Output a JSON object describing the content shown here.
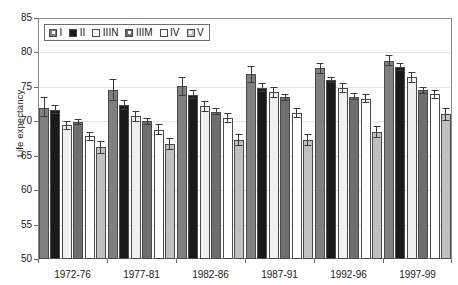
{
  "chart_data": {
    "type": "bar",
    "title": "",
    "subtitle": "",
    "xlabel": "",
    "ylabel": "Life expectancy",
    "ylim": [
      50,
      85
    ],
    "yticks": [
      50,
      55,
      60,
      65,
      70,
      75,
      80,
      85
    ],
    "grid": true,
    "legend_position": "top-left",
    "error_bars": true,
    "categories": [
      "1972-76",
      "1977-81",
      "1982-86",
      "1987-91",
      "1992-96",
      "1997-99"
    ],
    "series": [
      {
        "name": "I",
        "color": "#808080",
        "values": [
          72.0,
          74.6,
          75.1,
          76.8,
          77.7,
          78.8
        ],
        "err_low": [
          70.6,
          72.9,
          73.7,
          75.6,
          76.9,
          78.1
        ],
        "err_high": [
          73.5,
          76.2,
          76.4,
          78.0,
          78.5,
          79.6
        ]
      },
      {
        "name": "II",
        "color": "#1a1a1a",
        "values": [
          71.7,
          72.4,
          73.8,
          74.9,
          76.0,
          77.9
        ],
        "err_low": [
          71.0,
          71.7,
          73.2,
          74.3,
          75.5,
          77.3
        ],
        "err_high": [
          72.4,
          73.1,
          74.5,
          75.5,
          76.5,
          78.5
        ]
      },
      {
        "name": "IIIN",
        "color": "#f0f0f0",
        "values": [
          69.4,
          70.7,
          72.2,
          74.2,
          74.8,
          76.4
        ],
        "err_low": [
          68.7,
          69.9,
          71.4,
          73.4,
          74.1,
          75.6
        ],
        "err_high": [
          70.1,
          71.5,
          73.0,
          75.0,
          75.5,
          77.2
        ]
      },
      {
        "name": "IIIM",
        "color": "#6e6e6e",
        "values": [
          69.9,
          70.0,
          71.4,
          73.5,
          73.6,
          74.5
        ],
        "err_low": [
          69.4,
          69.5,
          70.9,
          73.0,
          73.1,
          74.0
        ],
        "err_high": [
          70.4,
          70.5,
          71.9,
          74.0,
          74.1,
          75.0
        ]
      },
      {
        "name": "IV",
        "color": "#ffffff",
        "values": [
          67.8,
          68.8,
          70.5,
          71.2,
          73.3,
          73.9
        ],
        "err_low": [
          67.2,
          68.0,
          69.8,
          70.5,
          72.6,
          73.2
        ],
        "err_high": [
          68.4,
          69.6,
          71.2,
          71.9,
          74.0,
          74.6
        ]
      },
      {
        "name": "V",
        "color": "#c0c0c0",
        "values": [
          66.2,
          66.7,
          67.3,
          67.3,
          68.4,
          71.0
        ],
        "err_low": [
          65.2,
          65.8,
          66.4,
          66.4,
          67.5,
          70.1
        ],
        "err_high": [
          67.2,
          67.6,
          68.2,
          68.2,
          69.3,
          71.9
        ]
      }
    ]
  },
  "axes": {
    "y_title": "Life expectancy",
    "y_tick_labels": [
      "85",
      "80",
      "75",
      "70",
      "65",
      "60",
      "55",
      "50"
    ],
    "x_tick_labels": [
      "1972-76",
      "1977-81",
      "1982-86",
      "1987-91",
      "1992-96",
      "1997-99"
    ]
  },
  "legend": {
    "items": [
      {
        "label": "I",
        "color": "#808080",
        "style": "inner"
      },
      {
        "label": "II",
        "color": "#1a1a1a",
        "style": "solid"
      },
      {
        "label": "IIIN",
        "color": "#f8f8f8",
        "style": "solid"
      },
      {
        "label": "IIIM",
        "color": "#6e6e6e",
        "style": "inner"
      },
      {
        "label": "IV",
        "color": "#ffffff",
        "style": "solid"
      },
      {
        "label": "V",
        "color": "#c0c0c0",
        "style": "inner"
      }
    ]
  }
}
